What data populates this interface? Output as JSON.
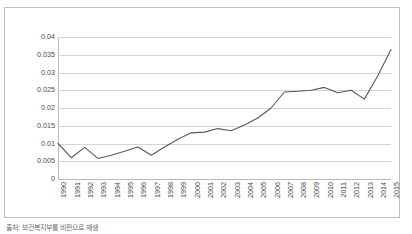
{
  "caption": "출처: 보건복지부를 비판으로 재생",
  "colors": {
    "line": "#595959",
    "gridline": "#d4d4d4",
    "frame_border": "#bfbfbf",
    "axis": "#b9b9b9",
    "label_text": "#4a4a4a",
    "background": "#ffffff"
  },
  "chart_data": {
    "type": "line",
    "title": "",
    "xlabel": "",
    "ylabel": "",
    "grid": true,
    "legend": "none",
    "ylim": [
      0,
      0.04
    ],
    "yticks": [
      0,
      0.005,
      0.01,
      0.015,
      0.02,
      0.025,
      0.03,
      0.035,
      0.04
    ],
    "ytick_labels": [
      "0",
      "0.005",
      "0.01",
      "0.015",
      "0.02",
      "0.025",
      "0.03",
      "0.035",
      "0.04"
    ],
    "categories": [
      "1990",
      "1991",
      "1992",
      "1993",
      "1994",
      "1995",
      "1996",
      "1997",
      "1998",
      "1999",
      "2000",
      "2001",
      "2002",
      "2003",
      "2004",
      "2005",
      "2006",
      "2007",
      "2008",
      "2009",
      "2010",
      "2011",
      "2012",
      "2013",
      "2014",
      "2015"
    ],
    "series": [
      {
        "name": "series-1",
        "values": [
          0.01,
          0.006,
          0.0089,
          0.0058,
          0.0067,
          0.0078,
          0.009,
          0.0067,
          0.009,
          0.0112,
          0.013,
          0.0132,
          0.0142,
          0.0136,
          0.0152,
          0.0172,
          0.02,
          0.0245,
          0.0247,
          0.025,
          0.0258,
          0.0243,
          0.025,
          0.0225,
          0.029,
          0.0365
        ]
      }
    ]
  }
}
